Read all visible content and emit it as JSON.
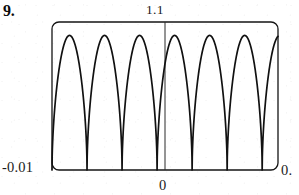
{
  "figure": {
    "problem_number": "9.",
    "frame": {
      "x_left": 52,
      "x_right": 278,
      "y_top": 22,
      "y_bottom": 170,
      "corner_radius": 7,
      "stroke_color": "#151515",
      "stroke_width": 1.3
    },
    "axis": {
      "vertical_center_x": 165,
      "vertical_line_top": 22,
      "vertical_line_bottom": 170,
      "stroke_color": "#2a2a2a",
      "stroke_width": 1
    }
  },
  "labels": {
    "y_max": "1.1",
    "x_min": "-0.01",
    "x_max": "0.",
    "x_zero": "0"
  },
  "chart_data": {
    "type": "line",
    "title": "",
    "subtitle": "",
    "xlabel": "",
    "ylabel": "",
    "xlim": [
      -0.01,
      0.01
    ],
    "ylim": [
      0,
      1.1
    ],
    "grid": false,
    "legend": null,
    "series": [
      {
        "name": "oscillation",
        "description": "rapidly oscillating non-negative wave with rounded peaks and narrow V-shaped troughs touching the x-axis",
        "peak_count": 6,
        "peak_value": 1.0,
        "trough_value": 0.0,
        "period": 0.0031,
        "x": [
          -0.01,
          -0.0097,
          -0.0094,
          -0.0091,
          -0.0088,
          -0.0085,
          -0.0082,
          -0.0079,
          -0.0076,
          -0.0073,
          -0.007,
          -0.0067,
          -0.0064,
          -0.0061,
          -0.0058,
          -0.0055,
          -0.0052,
          -0.0049,
          -0.0046,
          -0.0043,
          -0.004,
          -0.0037,
          -0.0034,
          -0.0031,
          -0.0028,
          -0.0025,
          -0.0022,
          -0.0019,
          -0.0016,
          -0.0013,
          -0.001,
          -0.0007,
          -0.0004,
          -0.0001,
          0.0002,
          0.0005,
          0.0008,
          0.0011,
          0.0014,
          0.0017,
          0.002,
          0.0023,
          0.0026,
          0.0029,
          0.0032,
          0.0035,
          0.0038,
          0.0041,
          0.0044,
          0.0047,
          0.005,
          0.0053,
          0.0056,
          0.0059,
          0.0062,
          0.0065,
          0.0068,
          0.0071,
          0.0074,
          0.0077,
          0.008,
          0.0083,
          0.0086,
          0.0089,
          0.0092,
          0.0095,
          0.0098,
          0.01
        ],
        "peaks_x": [
          -0.0084,
          -0.0053,
          -0.0021,
          0.0011,
          0.0042,
          0.0074
        ],
        "troughs_x": [
          -0.01,
          -0.0068,
          -0.0037,
          -0.0005,
          0.0026,
          0.0058,
          0.009
        ]
      }
    ],
    "tick_labels": {
      "y": [
        "1.1"
      ],
      "x": [
        "-0.01",
        "0",
        "0."
      ]
    }
  }
}
